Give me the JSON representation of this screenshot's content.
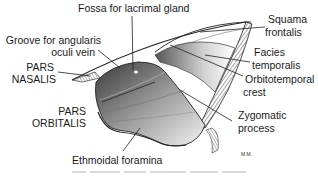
{
  "figure": {
    "labels": {
      "fossa": "Fossa for lacrimal gland",
      "groove_l1": "Groove for angularis",
      "groove_l2": "oculi vein",
      "pars_nasalis_l1": "PARS",
      "pars_nasalis_l2": "NASALIS",
      "squama_l1": "Squama",
      "squama_l2": "frontalis",
      "facies_l1": "Facies",
      "facies_l2": "temporalis",
      "orbito_l1": "Orbitotemporal",
      "orbito_l2": "crest",
      "pars_orbitalis_l1": "PARS",
      "pars_orbitalis_l2": "ORBITALIS",
      "zygo_l1": "Zygomatic",
      "zygo_l2": "process",
      "ethmoidal": "Ethmoidal foramina"
    },
    "artist_signature": "M.M.",
    "caption": ""
  },
  "colors": {
    "ink": "#1a1a1a",
    "bone_shade": "#8a8a8a",
    "background": "#ffffff"
  }
}
